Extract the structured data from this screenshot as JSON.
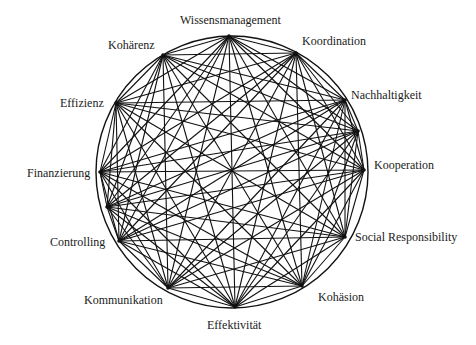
{
  "diagram": {
    "type": "complete-network-graph",
    "circle": {
      "cx": 232,
      "cy": 172,
      "r": 136
    },
    "line_color": "#111111",
    "nodes": [
      {
        "id": "wissensmanagement",
        "label": "Wissensmanagement",
        "x": 229,
        "y": 36,
        "lx": 180,
        "ly": 13
      },
      {
        "id": "koordination",
        "label": "Koordination",
        "x": 296,
        "y": 53,
        "lx": 302,
        "ly": 34
      },
      {
        "id": "nachhaltigkeit",
        "label": "Nachhaltigkeit",
        "x": 345,
        "y": 100,
        "lx": 351,
        "ly": 88
      },
      {
        "id": "node-r2",
        "label": "",
        "x": 358,
        "y": 131,
        "lx": 0,
        "ly": 0
      },
      {
        "id": "kooperation",
        "label": "Kooperation",
        "x": 364,
        "y": 170,
        "lx": 374,
        "ly": 158
      },
      {
        "id": "social-responsibility",
        "label": "Social Responsibility",
        "x": 345,
        "y": 237,
        "lx": 355,
        "ly": 230
      },
      {
        "id": "kohaesion",
        "label": "Kohäsion",
        "x": 302,
        "y": 286,
        "lx": 318,
        "ly": 290
      },
      {
        "id": "effektivitaet",
        "label": "Effektivität",
        "x": 235,
        "y": 307,
        "lx": 207,
        "ly": 318
      },
      {
        "id": "kommunikation",
        "label": "Kommunikation",
        "x": 168,
        "y": 288,
        "lx": 84,
        "ly": 293
      },
      {
        "id": "controlling",
        "label": "Controlling",
        "x": 119,
        "y": 241,
        "lx": 50,
        "ly": 235
      },
      {
        "id": "node-l2",
        "label": "",
        "x": 107,
        "y": 207,
        "lx": 0,
        "ly": 0
      },
      {
        "id": "finanzierung",
        "label": "Finanzierung",
        "x": 100,
        "y": 172,
        "lx": 27,
        "ly": 166
      },
      {
        "id": "effizienz",
        "label": "Effizienz",
        "x": 116,
        "y": 103,
        "lx": 60,
        "ly": 96
      },
      {
        "id": "kohaerenz",
        "label": "Kohärenz",
        "x": 163,
        "y": 55,
        "lx": 108,
        "ly": 38
      }
    ]
  }
}
